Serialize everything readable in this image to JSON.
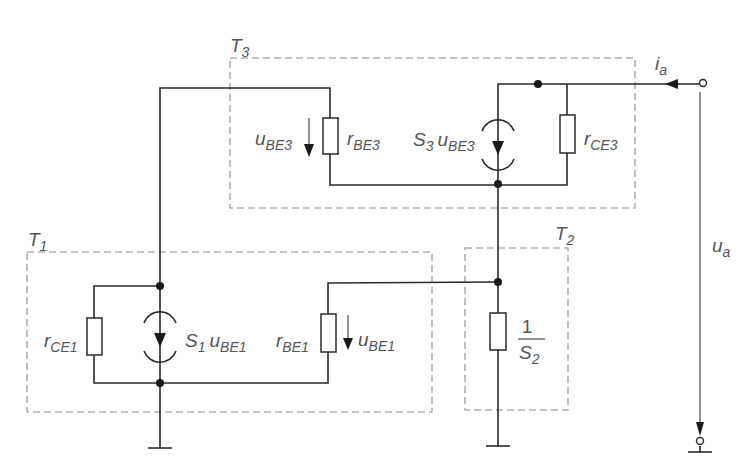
{
  "diagram": {
    "type": "small-signal equivalent circuit",
    "blocks": [
      {
        "id": "T3",
        "label_main": "T",
        "label_sub": "3"
      },
      {
        "id": "T1",
        "label_main": "T",
        "label_sub": "1"
      },
      {
        "id": "T2",
        "label_main": "T",
        "label_sub": "2"
      }
    ],
    "components": {
      "r_be3": {
        "main": "r",
        "sub": "BE3"
      },
      "u_be3": {
        "main": "u",
        "sub": "BE3"
      },
      "s3_source": {
        "coef_main": "S",
        "coef_sub": "3",
        "var_main": "u",
        "var_sub": "BE3"
      },
      "r_ce3": {
        "main": "r",
        "sub": "CE3"
      },
      "r_ce1": {
        "main": "r",
        "sub": "CE1"
      },
      "s1_source": {
        "coef_main": "S",
        "coef_sub": "1",
        "var_main": "u",
        "var_sub": "BE1"
      },
      "r_be1": {
        "main": "r",
        "sub": "BE1"
      },
      "u_be1": {
        "main": "u",
        "sub": "BE1"
      },
      "s2_resistor": {
        "numerator": "1",
        "denom_main": "S",
        "denom_sub": "2"
      }
    },
    "output": {
      "current": {
        "main": "i",
        "sub": "a"
      },
      "voltage": {
        "main": "u",
        "sub": "a"
      }
    }
  }
}
